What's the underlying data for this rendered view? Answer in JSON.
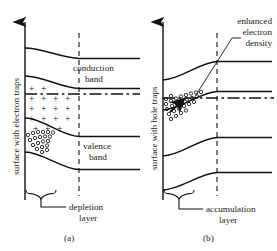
{
  "figure": {
    "type": "semiconductor-band-diagram",
    "panels": [
      {
        "id": "a",
        "caption": "(a)",
        "axis_label": "surface with electron traps",
        "band_labels": {
          "upper": "conduction",
          "upper2": "band",
          "lower": "valence",
          "lower2": "band"
        },
        "region_label_line1": "depletion",
        "region_label_line2": "layer",
        "charge_symbol": "+",
        "charge_rows": 5,
        "charge_cols": 4,
        "band_bending": "upward",
        "space_charge": "positive"
      },
      {
        "id": "b",
        "caption": "(b)",
        "axis_label": "surface with hole traps",
        "annotation_line1": "enhanced",
        "annotation_line2": "electron",
        "annotation_line3": "density",
        "region_label_line1": "accumulation",
        "region_label_line2": "layer",
        "band_bending": "downward",
        "space_charge": "negative"
      }
    ],
    "colors": {
      "ink": "#111111",
      "background": "#ffffff"
    }
  }
}
